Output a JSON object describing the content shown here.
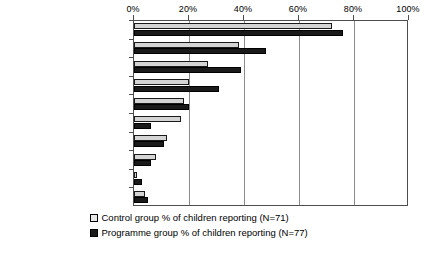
{
  "chart_data": {
    "type": "bar",
    "orientation": "horizontal",
    "title": "",
    "subtitle": "",
    "xlabel": "",
    "ylabel": "",
    "xlim": [
      0,
      100
    ],
    "xticks": [
      "0%",
      "20%",
      "40%",
      "60%",
      "80%",
      "100%"
    ],
    "xtick_values": [
      0,
      20,
      40,
      60,
      80,
      100
    ],
    "grid": true,
    "legend_position": "bottom",
    "categories": [
      "mother",
      "father",
      "mother and father",
      "siblings",
      "teacher",
      "peers at school",
      "grandparents",
      "others in family",
      "alone but also with others",
      "alone only"
    ],
    "series": [
      {
        "name": "Control group % of children reporting (N=71)",
        "color": "#d4d4d4",
        "values": [
          72,
          38,
          27,
          20,
          18,
          17,
          12,
          8,
          1,
          4
        ]
      },
      {
        "name": "Programme group % of children reporting (N=77)",
        "color": "#1a1a1a",
        "values": [
          76,
          48,
          39,
          31,
          20,
          6,
          11,
          6,
          3,
          5
        ]
      }
    ]
  },
  "legend": {
    "entries": [
      {
        "swatch": "control",
        "label": "Control group % of children reporting (N=71)"
      },
      {
        "swatch": "programme",
        "label": "Programme group % of children reporting (N=77)"
      }
    ]
  },
  "colors": {
    "control_fill": "#d4d4d4",
    "programme_fill": "#1a1a1a",
    "gridline": "#8c8c8c",
    "frame": "#4d4d4d",
    "background": "#ffffff"
  }
}
